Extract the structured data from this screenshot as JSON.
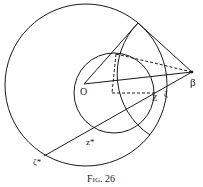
{
  "figure": {
    "caption": "Fig. 26",
    "stroke_color": "#1a1a1a",
    "background": "#ffffff"
  },
  "labels": {
    "origin": "O",
    "beta": "β",
    "z": "Z",
    "zeta": "ζ",
    "z_star": "z*",
    "zeta_star": "ζ*",
    "angle_mark": "∟"
  },
  "geometry": {
    "big_circle": {
      "cx": 86,
      "cy": 85,
      "r": 81
    },
    "small_circle": {
      "cx": 114,
      "cy": 93,
      "r": 40
    },
    "arc_about_beta": {
      "cx": 192,
      "cy": 72,
      "r": 73
    },
    "points": {
      "O": [
        84,
        84
      ],
      "beta": [
        192,
        72
      ],
      "tangent": [
        138,
        23
      ],
      "top_small": [
        116,
        54
      ],
      "foot": [
        112,
        93
      ],
      "Z": [
        155,
        93
      ],
      "z_star": [
        92,
        133
      ],
      "zeta_star": [
        44,
        156
      ]
    }
  }
}
